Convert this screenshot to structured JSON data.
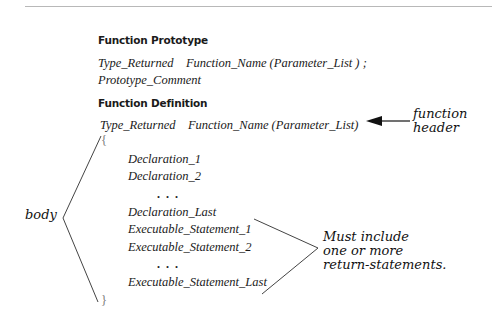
{
  "prototype": {
    "heading": "Function Prototype",
    "line1": "Type_Returned    Function_Name (Parameter_List ) ;",
    "line2": "Prototype_Comment"
  },
  "definition": {
    "heading": "Function Definition",
    "header_line": "Type_Returned    Function_Name (Parameter_List)",
    "open_brace": "{",
    "close_brace": "}",
    "declarations": [
      "Declaration_1",
      "Declaration_2"
    ],
    "dots": "...",
    "declaration_last": "Declaration_Last",
    "statements": [
      "Executable_Statement_1",
      "Executable_Statement_2"
    ],
    "statement_last": "Executable_Statement_Last"
  },
  "annotations": {
    "function_header": "function\nheader",
    "body": "body",
    "return_note": "Must include\none or more\nreturn-statements."
  }
}
